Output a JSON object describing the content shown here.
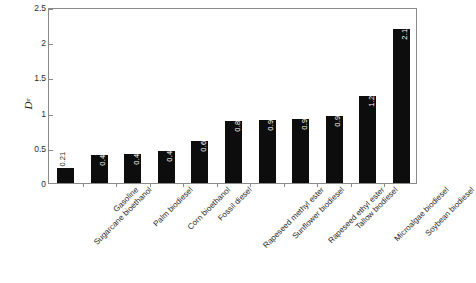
{
  "chart_data": {
    "type": "bar",
    "title": "",
    "subtitle": "",
    "xlabel": "",
    "ylabel": "De",
    "ylabel_base": "D",
    "ylabel_subscript": "e",
    "ylim": [
      0,
      2.5
    ],
    "yticks": [
      "0",
      "0.5",
      "1",
      "1.5",
      "2",
      "2.5"
    ],
    "ytick_values": [
      0,
      0.5,
      1,
      1.5,
      2,
      2.5
    ],
    "grid": false,
    "legend": null,
    "bar_color": "#0d0d0d",
    "frame_color": "#8a8a8a",
    "categories": [
      "Sugarcane bioethanol",
      "Gasoline",
      "Palm biodiesel",
      "Corn bioethanol",
      "Fossil diesel",
      "Rapeseed methyl ester",
      "Sunflower biodiesel",
      "Rapeseed ethyl ester",
      "Tallow biodiesel",
      "Microalgae biodiesel",
      "Soybean biodiesel"
    ],
    "values": [
      0.21,
      0.4,
      0.41,
      0.45,
      0.6,
      0.88,
      0.9,
      0.91,
      0.95,
      1.24,
      2.19
    ],
    "value_labels": [
      "0.21",
      "0.40",
      "0.41",
      "0.45",
      "0.60",
      "0.88",
      "0.90",
      "0.91",
      "0.95",
      "1.24",
      "2.19"
    ],
    "label_placement": [
      "outside",
      "inside",
      "inside",
      "inside",
      "inside",
      "inside",
      "inside",
      "inside",
      "inside",
      "inside",
      "inside"
    ]
  }
}
